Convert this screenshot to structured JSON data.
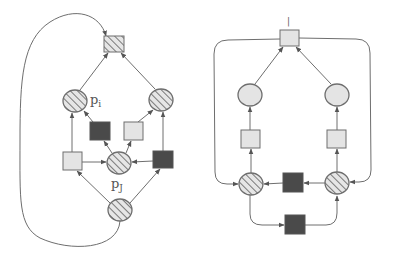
{
  "colors": {
    "background": "#ffffff",
    "stroke": "#6e6e6e",
    "light_fill": "#e4e4e4",
    "dark_fill": "#4a4a4a",
    "hatch_bg": "#e6e6e6",
    "hatch_line": "#7a7a7a"
  },
  "labels": {
    "p_i": "p",
    "p_i_sub": "i",
    "p_j": "p",
    "p_j_sub": "J",
    "right_top_mark": "|"
  },
  "diagrams": [
    {
      "name": "left-petri-net",
      "places": [
        {
          "id": "p_i",
          "cx": 75,
          "cy": 101,
          "fill": "hatched"
        },
        {
          "id": "p_right",
          "cx": 161,
          "cy": 100,
          "fill": "hatched"
        },
        {
          "id": "p_j",
          "cx": 119,
          "cy": 163,
          "fill": "hatched"
        },
        {
          "id": "p_bottom",
          "cx": 120,
          "cy": 210,
          "fill": "hatched"
        }
      ],
      "transitions": [
        {
          "id": "t_top",
          "x": 104,
          "y": 36,
          "fill": "hatched"
        },
        {
          "id": "t_dark_mid",
          "x": 90,
          "y": 122,
          "fill": "dark"
        },
        {
          "id": "t_light_mid",
          "x": 124,
          "y": 122,
          "fill": "light"
        },
        {
          "id": "t_left",
          "x": 63,
          "y": 152,
          "fill": "light"
        },
        {
          "id": "t_right",
          "x": 153,
          "y": 151,
          "fill": "dark"
        }
      ]
    },
    {
      "name": "right-petri-net",
      "places": [
        {
          "id": "q_left_top",
          "cx": 250,
          "cy": 95,
          "fill": "light"
        },
        {
          "id": "q_right_top",
          "cx": 337,
          "cy": 95,
          "fill": "light"
        },
        {
          "id": "q_left_bot",
          "cx": 251,
          "cy": 184,
          "fill": "hatched"
        },
        {
          "id": "q_right_bot",
          "cx": 337,
          "cy": 183,
          "fill": "hatched"
        }
      ],
      "transitions": [
        {
          "id": "u_top",
          "x": 280,
          "y": 30,
          "fill": "light"
        },
        {
          "id": "u_left",
          "x": 241,
          "y": 130,
          "fill": "light"
        },
        {
          "id": "u_right",
          "x": 327,
          "y": 130,
          "fill": "light"
        },
        {
          "id": "u_mid",
          "x": 283,
          "y": 173,
          "fill": "dark"
        },
        {
          "id": "u_bottom",
          "x": 285,
          "y": 215,
          "fill": "dark"
        }
      ]
    }
  ]
}
